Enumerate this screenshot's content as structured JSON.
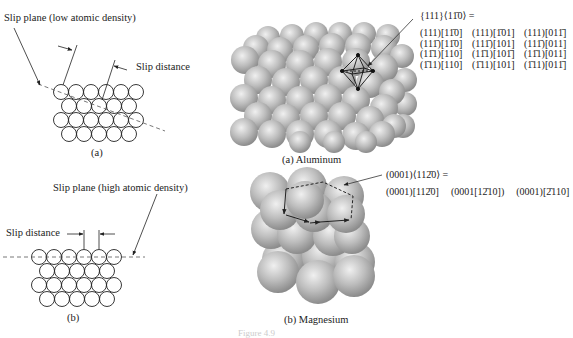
{
  "panel_a": {
    "slip_plane_label": "Slip plane (low atomic density)",
    "slip_distance_label": "Slip distance",
    "caption": "(a)"
  },
  "panel_b": {
    "slip_plane_label": "Slip plane (high atomic density)",
    "slip_distance_label": "Slip distance",
    "caption": "(b)"
  },
  "aluminum": {
    "family_label": "{111}⟨11̄0⟩ =",
    "systems": [
      [
        "(111)[11̄0]",
        "(111)[1̄01]",
        "(111)[011̄]"
      ],
      [
        "(111̄)[11̄0]",
        "(111̄)[101]",
        "(111̄)[011]"
      ],
      [
        "(11̄1)[110]",
        "(11̄1)[101̄]",
        "(11̄1)[011]"
      ],
      [
        "(1̄11)[110]",
        "(1̄11)[101]",
        "(1̄11)[011̄]"
      ]
    ],
    "caption": "(a) Aluminum"
  },
  "magnesium": {
    "family_label": "(0001)⟨112̄0⟩ =",
    "systems": [
      "(0001)[112̄0]",
      "(0001[12̄10])",
      "(0001)[2̄110]"
    ],
    "caption": "(b) Magnesium"
  },
  "figure_label": "Figure 4.9"
}
